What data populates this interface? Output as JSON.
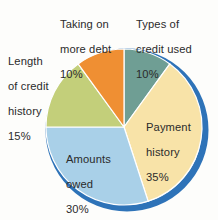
{
  "chart_data": {
    "type": "pie",
    "title": "",
    "subtitle": "",
    "xlabel": "",
    "ylabel": "",
    "legend_position": "none",
    "grid": false,
    "start_angle_deg": 0,
    "direction": "clockwise",
    "categories": [
      "Types of credit used",
      "Payment history",
      "Amounts owed",
      "Length of credit history",
      "Taking on more debt"
    ],
    "values": [
      10,
      35,
      30,
      15,
      10
    ],
    "value_unit": "%",
    "slices": [
      {
        "name": "types-of-credit-used",
        "label": "Types of\ncredit used",
        "label_lines": [
          "Types of",
          "credit used"
        ],
        "value": 10,
        "value_text": "10%",
        "color": "#6f9e94",
        "label_placement": "outside-top-right"
      },
      {
        "name": "payment-history",
        "label": "Payment\nhistory",
        "label_lines": [
          "Payment",
          "history"
        ],
        "value": 35,
        "value_text": "35%",
        "color": "#f8e3a8",
        "label_placement": "inside-right"
      },
      {
        "name": "amounts-owed",
        "label": "Amounts\nowed",
        "label_lines": [
          "Amounts",
          "owed"
        ],
        "value": 30,
        "value_text": "30%",
        "color": "#a9d0e8",
        "label_placement": "inside-bottom-left"
      },
      {
        "name": "length-of-credit-history",
        "label": "Length\nof credit\nhistory",
        "label_lines": [
          "Length",
          "of credit",
          "history"
        ],
        "value": 15,
        "value_text": "15%",
        "color": "#c3cf7a",
        "label_placement": "outside-left"
      },
      {
        "name": "taking-on-more-debt",
        "label": "Taking on\nmore debt",
        "label_lines": [
          "Taking on",
          "more debt"
        ],
        "value": 10,
        "value_text": "10%",
        "color": "#ef8f33",
        "label_placement": "outside-top"
      }
    ],
    "colors": {
      "types_of_credit_used": "#6f9e94",
      "payment_history": "#f8e3a8",
      "amounts_owed": "#a9d0e8",
      "length_of_credit_history": "#c3cf7a",
      "taking_on_more_debt": "#ef8f33",
      "rim_shadow": "#2e73b8",
      "text": "#2b2b2b",
      "background": "#fdfdfb"
    }
  },
  "labels": {
    "taking_on_more_debt": {
      "line1": "Taking on",
      "line2": "more debt",
      "value": "10%"
    },
    "types_of_credit_used": {
      "line1": "Types of",
      "line2": "credit used",
      "value": "10%"
    },
    "length_of_credit_history": {
      "line1": "Length",
      "line2": "of credit",
      "line3": "history",
      "value": "15%"
    },
    "payment_history": {
      "line1": "Payment",
      "line2": "history",
      "value": "35%"
    },
    "amounts_owed": {
      "line1": "Amounts",
      "line2": "owed",
      "value": "30%"
    }
  }
}
